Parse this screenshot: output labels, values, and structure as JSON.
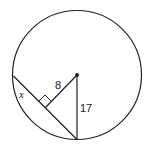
{
  "diagram": {
    "type": "circle-chord-geometry",
    "labels": {
      "perpendicular_distance": "8",
      "radius": "17",
      "half_chord": "x"
    },
    "colors": {
      "stroke": "#222222",
      "background": "#ffffff"
    }
  }
}
